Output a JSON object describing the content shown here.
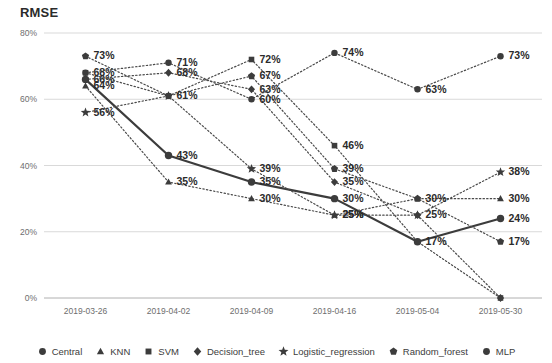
{
  "chart_data": {
    "type": "line",
    "title": "RMSE",
    "xlabel": "",
    "ylabel": "",
    "ylim": [
      0,
      80
    ],
    "yticks": [
      "0%",
      "20%",
      "40%",
      "60%",
      "80%"
    ],
    "ytick_values": [
      0,
      20,
      40,
      60,
      80
    ],
    "grid": true,
    "legend_position": "bottom",
    "categories": [
      "2019-03-26",
      "2019-04-02",
      "2019-04-09",
      "2019-04-16",
      "2019-05-04",
      "2019-05-30"
    ],
    "series": [
      {
        "name": "Central",
        "marker": "circle",
        "style": "solid",
        "values": [
          66,
          43,
          35,
          30,
          17,
          24
        ],
        "labels": [
          "66%",
          "43%",
          "35%",
          "30%",
          "17%",
          "24%"
        ],
        "label_shown": [
          true,
          true,
          true,
          true,
          true,
          true
        ]
      },
      {
        "name": "KNN",
        "marker": "triangle",
        "style": "dotted",
        "values": [
          64,
          35,
          30,
          25,
          30,
          30
        ],
        "labels": [
          "64%",
          "35%",
          "30%",
          "25%",
          "30%",
          "30%"
        ],
        "label_shown": [
          true,
          true,
          true,
          true,
          false,
          true
        ]
      },
      {
        "name": "SVM",
        "marker": "square",
        "style": "dotted",
        "values": [
          68,
          61,
          72,
          46,
          17,
          0
        ],
        "labels": [
          "68%",
          "61%",
          "72%",
          "46%",
          "17%",
          "0%"
        ],
        "label_shown": [
          true,
          false,
          true,
          true,
          false,
          false
        ]
      },
      {
        "name": "Decision_tree",
        "marker": "diamond",
        "style": "dotted",
        "values": [
          66,
          68,
          63,
          35,
          25,
          0
        ],
        "labels": [
          "66%",
          "68%",
          "63%",
          "35%",
          "25%",
          "0%"
        ],
        "label_shown": [
          false,
          true,
          true,
          true,
          true,
          false
        ]
      },
      {
        "name": "Logistic_regression",
        "marker": "star",
        "style": "dotted",
        "values": [
          56,
          61,
          39,
          25,
          25,
          38
        ],
        "labels": [
          "56%",
          "61%",
          "39%",
          "25%",
          "25%",
          "38%"
        ],
        "label_shown": [
          true,
          false,
          true,
          true,
          false,
          true
        ]
      },
      {
        "name": "Random_forest",
        "marker": "pentagon",
        "style": "dotted",
        "values": [
          73,
          61,
          67,
          39,
          30,
          17
        ],
        "labels": [
          "73%",
          "61%",
          "67%",
          "39%",
          "30%",
          "17%"
        ],
        "label_shown": [
          true,
          true,
          true,
          true,
          true,
          true
        ]
      },
      {
        "name": "MLP",
        "marker": "circle",
        "style": "dotted",
        "values": [
          68,
          71,
          60,
          74,
          63,
          73
        ],
        "labels": [
          "68%",
          "71%",
          "60%",
          "74%",
          "63%",
          "73%"
        ],
        "label_shown": [
          false,
          true,
          true,
          true,
          true,
          true
        ]
      }
    ],
    "colors": {
      "line": "#4a4a4a",
      "solid_line": "#3c3c3c",
      "marker": "#3c3c3c",
      "grid": "#d9d9d9",
      "label_text": "#2b2b2b",
      "tick_text": "#6e6e6e"
    }
  }
}
